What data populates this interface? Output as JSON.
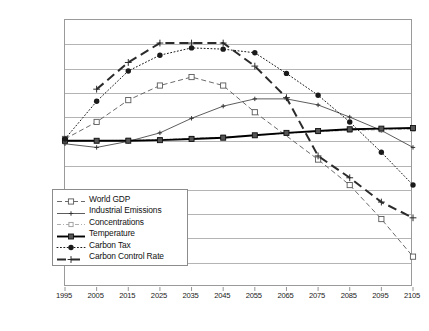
{
  "chart_data": {
    "type": "line",
    "title": "",
    "xlabel": "",
    "ylabel": "",
    "grid": true,
    "legend_position": "inside-lower-left",
    "categories": [
      "1995",
      "2005",
      "2015",
      "2025",
      "2035",
      "2045",
      "2055",
      "2065",
      "2075",
      "2085",
      "2095",
      "2105"
    ],
    "x": [
      1995,
      2005,
      2015,
      2025,
      2035,
      2045,
      2055,
      2065,
      2075,
      2085,
      2095,
      2105
    ],
    "xlim": [
      1995,
      2105
    ],
    "ylim": [
      -12,
      10
    ],
    "ytick_labels": [
      "10%",
      "8%",
      "6%",
      "4%",
      "2%",
      "0%",
      "-2%",
      "-4%",
      "-6%",
      "-8%",
      "-10%",
      "-12%"
    ],
    "ytick_values": [
      10,
      8,
      6,
      4,
      2,
      0,
      -2,
      -4,
      -6,
      -8,
      -10,
      -12
    ],
    "series": [
      {
        "name": "World GDP",
        "style": "dashed",
        "marker": "open-square",
        "color": "#5a5a5a",
        "values": [
          0.2,
          1.6,
          3.4,
          4.6,
          5.3,
          4.6,
          2.4,
          null,
          -1.5,
          -3.6,
          -6.4,
          -9.5
        ]
      },
      {
        "name": "Industrial Emissions",
        "style": "solid-thin",
        "marker": "small-cross",
        "color": "#333333",
        "values": [
          -0.2,
          -0.5,
          0.0,
          0.7,
          1.9,
          2.9,
          3.5,
          3.5,
          3.0,
          2.0,
          0.9,
          -0.5
        ]
      },
      {
        "name": "Concentrations",
        "style": "dash-dot-light",
        "marker": "small-open-square",
        "color": "#9a9a9a",
        "values": [
          0.0,
          0.05,
          0.1,
          0.15,
          0.25,
          0.35,
          0.5,
          0.65,
          0.8,
          0.9,
          0.95,
          1.0
        ]
      },
      {
        "name": "Temperature",
        "style": "solid-thick",
        "marker": "filled-square",
        "color": "#000000",
        "values": [
          0.05,
          0.05,
          0.05,
          0.1,
          0.2,
          0.3,
          0.5,
          0.7,
          0.85,
          1.0,
          1.05,
          1.1
        ]
      },
      {
        "name": "Carbon Tax",
        "style": "dotted",
        "marker": "filled-circle",
        "color": "#1a1a1a",
        "values": [
          0.2,
          3.3,
          5.8,
          7.1,
          7.7,
          7.6,
          7.3,
          5.6,
          3.8,
          1.6,
          -0.9,
          -3.6
        ]
      },
      {
        "name": "Carbon Control Rate",
        "style": "long-dash-thick",
        "marker": "cross",
        "color": "#2b2b2b",
        "values": [
          null,
          4.3,
          6.5,
          8.1,
          8.1,
          8.1,
          6.2,
          3.6,
          -1.2,
          -3.0,
          -5.0,
          -6.3
        ]
      }
    ]
  },
  "legend": {
    "items": [
      {
        "label": "World GDP"
      },
      {
        "label": "Industrial Emissions"
      },
      {
        "label": "Concentrations"
      },
      {
        "label": "Temperature"
      },
      {
        "label": "Carbon Tax"
      },
      {
        "label": "Carbon Control Rate"
      }
    ]
  }
}
